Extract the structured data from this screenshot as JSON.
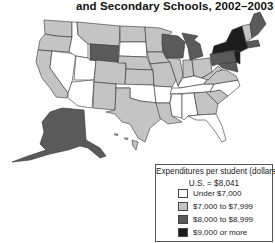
{
  "title": "and Secondary Schools, 2002–2003",
  "colors": {
    "under_7000": "#ffffff",
    "7000_7999": "#c4c4c4",
    "8000_8999": "#5a5a5a",
    "9000_plus": "#1c1c1c",
    "border": "#333333"
  },
  "legend": {
    "title": "Expenditures per student (dollars)",
    "us_average": "U.S. = $8,041",
    "items": [
      {
        "label": "Under $7,000",
        "color": "#ffffff"
      },
      {
        "label": "$7,000 to $7,999",
        "color": "#c4c4c4"
      },
      {
        "label": "$8,000 to $8,999",
        "color": "#5a5a5a"
      },
      {
        "label": "$9,000 or more",
        "color": "#1c1c1c"
      }
    ]
  },
  "map_regions": [
    {
      "region": "Pacific Northwest",
      "category": "7000_7999"
    },
    {
      "region": "California",
      "category": "7000_7999"
    },
    {
      "region": "Nevada",
      "category": "under_7000"
    },
    {
      "region": "Idaho",
      "category": "under_7000"
    },
    {
      "region": "Utah",
      "category": "under_7000"
    },
    {
      "region": "Arizona",
      "category": "under_7000"
    },
    {
      "region": "Montana",
      "category": "7000_7999"
    },
    {
      "region": "Wyoming",
      "category": "8000_8999"
    },
    {
      "region": "Colorado",
      "category": "7000_7999"
    },
    {
      "region": "New Mexico",
      "category": "7000_7999"
    },
    {
      "region": "Texas",
      "category": "7000_7999"
    },
    {
      "region": "Wisconsin",
      "category": "8000_8999"
    },
    {
      "region": "Michigan",
      "category": "8000_8999"
    },
    {
      "region": "New York",
      "category": "9000_plus"
    },
    {
      "region": "New Jersey",
      "category": "9000_plus"
    },
    {
      "region": "Pennsylvania",
      "category": "8000_8999"
    },
    {
      "region": "Maine",
      "category": "8000_8999"
    },
    {
      "region": "Alaska",
      "category": "8000_8999"
    },
    {
      "region": "Hawaii",
      "category": "7000_7999"
    }
  ]
}
